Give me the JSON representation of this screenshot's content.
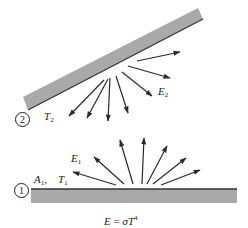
{
  "diagram": {
    "colors": {
      "plate_fill": "#a9a9a9",
      "plate_edge": "#333333",
      "arrow": "#2a2a2a",
      "background": "#ffffff"
    },
    "surface_2": {
      "number": "2",
      "temperature_label": {
        "symbol": "T",
        "sub": "2"
      },
      "emission_label": {
        "symbol": "E",
        "sub": "2"
      }
    },
    "surface_1": {
      "number": "1",
      "area_label": {
        "symbol": "A",
        "sub": "1",
        "sep": ","
      },
      "temperature_label": {
        "symbol": "T",
        "sub": "1"
      },
      "emission_label": {
        "symbol": "E",
        "sub": "1"
      }
    },
    "equation": {
      "lhs": "E",
      "eq": " = ",
      "sigma": "σ",
      "T": "T",
      "exp": "4"
    },
    "surface_2_arrows": [
      {
        "x1": 104,
        "y1": 80,
        "x2": 69,
        "y2": 116
      },
      {
        "x1": 108,
        "y1": 79,
        "x2": 87,
        "y2": 118
      },
      {
        "x1": 110,
        "y1": 78,
        "x2": 108,
        "y2": 121
      },
      {
        "x1": 116,
        "y1": 76,
        "x2": 128,
        "y2": 113
      },
      {
        "x1": 122,
        "y1": 72,
        "x2": 152,
        "y2": 96
      },
      {
        "x1": 128,
        "y1": 66,
        "x2": 170,
        "y2": 78
      },
      {
        "x1": 137,
        "y1": 61,
        "x2": 180,
        "y2": 52
      }
    ],
    "surface_1_arrows": [
      {
        "x1": 116,
        "y1": 185,
        "x2": 73,
        "y2": 172
      },
      {
        "x1": 124,
        "y1": 184,
        "x2": 94,
        "y2": 157
      },
      {
        "x1": 133,
        "y1": 184,
        "x2": 120,
        "y2": 140
      },
      {
        "x1": 142,
        "y1": 184,
        "x2": 144,
        "y2": 138
      },
      {
        "x1": 147,
        "y1": 184,
        "x2": 167,
        "y2": 146
      },
      {
        "x1": 153,
        "y1": 184,
        "x2": 186,
        "y2": 158
      },
      {
        "x1": 161,
        "y1": 185,
        "x2": 200,
        "y2": 170
      }
    ]
  }
}
